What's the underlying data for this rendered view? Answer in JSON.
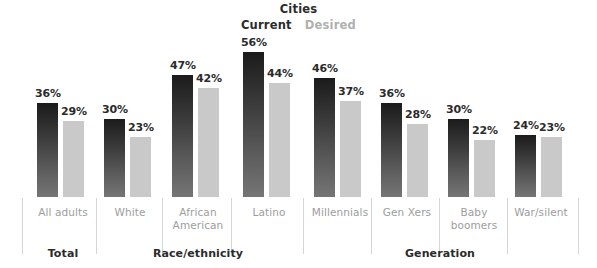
{
  "chart_data": {
    "type": "bar",
    "title": "Cities",
    "xlabel": "",
    "ylabel": "",
    "ylim": [
      0,
      62
    ],
    "grid": false,
    "legend_position": "top-center",
    "value_suffix": "%",
    "categories": [
      "All adults",
      "White",
      "African American",
      "Latino",
      "Millennials",
      "Gen Xers",
      "Baby boomers",
      "War/silent"
    ],
    "series": [
      {
        "name": "Current",
        "color": "#1b1b1b",
        "values": [
          36,
          30,
          47,
          56,
          46,
          36,
          30,
          24
        ],
        "labels": [
          "36%",
          "30%",
          "47%",
          "56%",
          "46%",
          "36%",
          "30%",
          "24%"
        ]
      },
      {
        "name": "Desired",
        "color": "#c9c9c9",
        "values": [
          29,
          23,
          42,
          44,
          37,
          28,
          22,
          23
        ],
        "labels": [
          "29%",
          "23%",
          "42%",
          "44%",
          "37%",
          "28%",
          "22%",
          "23%"
        ]
      }
    ],
    "groups": [
      {
        "label": "Total",
        "categories": [
          "All adults"
        ]
      },
      {
        "label": "Race/ethnicity",
        "categories": [
          "White",
          "African American",
          "Latino"
        ]
      },
      {
        "label": "Generation",
        "categories": [
          "Millennials",
          "Gen Xers",
          "Baby boomers",
          "War/silent"
        ]
      }
    ]
  },
  "header": {
    "title": "Cities",
    "legend": {
      "current": "Current",
      "desired": "Desired"
    }
  },
  "bars": [
    {
      "index": 0,
      "category": "All adults",
      "current_label": "36%",
      "desired_label": "29%",
      "left": 37,
      "current_h": 94,
      "desired_h": 76
    },
    {
      "index": 1,
      "category": "White",
      "current_label": "30%",
      "desired_label": "23%",
      "left": 104,
      "current_h": 78,
      "desired_h": 60
    },
    {
      "index": 2,
      "category": "African American",
      "current_label": "47%",
      "desired_label": "42%",
      "left": 172,
      "current_h": 122,
      "desired_h": 109
    },
    {
      "index": 3,
      "category": "Latino",
      "current_label": "56%",
      "desired_label": "44%",
      "left": 243,
      "current_h": 145,
      "desired_h": 114
    },
    {
      "index": 4,
      "category": "Millennials",
      "current_label": "46%",
      "desired_label": "37%",
      "left": 314,
      "current_h": 119,
      "desired_h": 96
    },
    {
      "index": 5,
      "category": "Gen Xers",
      "current_label": "36%",
      "desired_label": "28%",
      "left": 381,
      "current_h": 94,
      "desired_h": 73
    },
    {
      "index": 6,
      "category": "Baby boomers",
      "current_label": "30%",
      "desired_label": "22%",
      "left": 448,
      "current_h": 78,
      "desired_h": 57
    },
    {
      "index": 7,
      "category": "War/silent",
      "current_label": "24%",
      "desired_label": "23%",
      "left": 515,
      "current_h": 62,
      "desired_h": 60
    }
  ],
  "category_labels": [
    {
      "text": "All adults",
      "center": 63,
      "width": 90
    },
    {
      "text": "White",
      "center": 130,
      "width": 90
    },
    {
      "text": "African\nAmerican",
      "center": 198,
      "width": 90
    },
    {
      "text": "Latino",
      "center": 269,
      "width": 90
    },
    {
      "text": "Millennials",
      "center": 340,
      "width": 90
    },
    {
      "text": "Gen Xers",
      "center": 407,
      "width": 90
    },
    {
      "text": "Baby\nboomers",
      "center": 474,
      "width": 90
    },
    {
      "text": "War/silent",
      "center": 541,
      "width": 90
    }
  ],
  "group_labels": [
    {
      "text": "Total",
      "center": 63,
      "width": 140
    },
    {
      "text": "Race/ethnicity",
      "center": 198,
      "width": 180
    },
    {
      "text": "Generation",
      "center": 440,
      "width": 220
    }
  ],
  "dividers": [
    22,
    96,
    162,
    231,
    303,
    371,
    439,
    507,
    578
  ],
  "colors": {
    "current_bar_top": "#1b1b1b",
    "current_bar_bottom": "#757575",
    "desired_bar": "#c9c9c9",
    "label_text": "#2b2b2b",
    "category_text": "#9d9d9d",
    "divider": "#d6d6d6",
    "background": "#ffffff"
  }
}
